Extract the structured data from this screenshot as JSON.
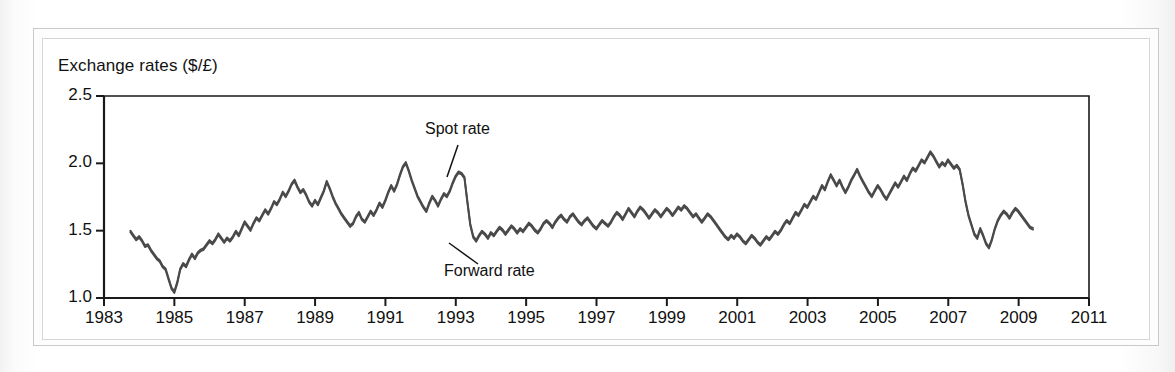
{
  "figure": {
    "title": "Exchange rates ($/£)",
    "line_color": "#4a4a4a",
    "axis_color": "#1a1a1a",
    "frame_color": "#c9c9c9"
  },
  "annotations": [
    {
      "name": "spot-rate",
      "label": "Spot rate",
      "x": 425,
      "y": 120,
      "leader": {
        "x1": 458,
        "y1": 145,
        "x2": 447,
        "y2": 177
      }
    },
    {
      "name": "forward-rate",
      "label": "Forward rate",
      "x": 444,
      "y": 262,
      "leader": {
        "x1": 449,
        "y1": 243,
        "x2": 478,
        "y2": 264
      }
    }
  ],
  "chart_data": {
    "type": "line",
    "title": "Exchange rates ($/£)",
    "xlabel": "",
    "ylabel": "Exchange rates ($/£)",
    "xlim": [
      1983,
      2011
    ],
    "ylim": [
      1.0,
      2.5
    ],
    "yticks": [
      1.0,
      1.5,
      2.0,
      2.5
    ],
    "ytick_labels": [
      "1.0",
      "1.5",
      "2.0",
      "2.5"
    ],
    "xticks": [
      1983,
      1985,
      1987,
      1989,
      1991,
      1993,
      1995,
      1997,
      1999,
      2001,
      2003,
      2005,
      2007,
      2009,
      2011
    ],
    "xtick_labels": [
      "1983",
      "1985",
      "1987",
      "1989",
      "1991",
      "1993",
      "1995",
      "1997",
      "1999",
      "2001",
      "2003",
      "2005",
      "2007",
      "2009",
      "2011"
    ],
    "grid": false,
    "legend": "annotated-inline",
    "legend_entries": [
      "Spot rate",
      "Forward rate"
    ],
    "note": "Spot and forward rate series lie almost on top of each other; drawn as two near-identical traces.",
    "series": [
      {
        "name": "Spot rate",
        "x_start": 1983.75,
        "x_step": 0.0833,
        "values": [
          1.5,
          1.47,
          1.44,
          1.46,
          1.43,
          1.39,
          1.4,
          1.36,
          1.33,
          1.3,
          1.28,
          1.24,
          1.22,
          1.15,
          1.08,
          1.05,
          1.12,
          1.22,
          1.26,
          1.24,
          1.29,
          1.33,
          1.3,
          1.34,
          1.36,
          1.37,
          1.4,
          1.43,
          1.41,
          1.44,
          1.48,
          1.45,
          1.42,
          1.45,
          1.43,
          1.46,
          1.5,
          1.47,
          1.52,
          1.57,
          1.54,
          1.51,
          1.56,
          1.6,
          1.58,
          1.62,
          1.66,
          1.63,
          1.67,
          1.72,
          1.7,
          1.74,
          1.79,
          1.76,
          1.8,
          1.85,
          1.88,
          1.83,
          1.79,
          1.81,
          1.77,
          1.72,
          1.69,
          1.73,
          1.7,
          1.75,
          1.8,
          1.87,
          1.82,
          1.76,
          1.71,
          1.67,
          1.63,
          1.6,
          1.57,
          1.54,
          1.56,
          1.61,
          1.64,
          1.59,
          1.57,
          1.61,
          1.65,
          1.62,
          1.66,
          1.71,
          1.68,
          1.73,
          1.79,
          1.84,
          1.8,
          1.85,
          1.92,
          1.98,
          2.01,
          1.95,
          1.88,
          1.82,
          1.76,
          1.72,
          1.68,
          1.65,
          1.71,
          1.76,
          1.73,
          1.69,
          1.74,
          1.78,
          1.76,
          1.8,
          1.86,
          1.91,
          1.94,
          1.93,
          1.9,
          1.72,
          1.55,
          1.46,
          1.43,
          1.47,
          1.5,
          1.48,
          1.45,
          1.49,
          1.47,
          1.5,
          1.53,
          1.51,
          1.48,
          1.51,
          1.54,
          1.52,
          1.49,
          1.52,
          1.5,
          1.53,
          1.56,
          1.54,
          1.51,
          1.49,
          1.52,
          1.56,
          1.58,
          1.56,
          1.53,
          1.57,
          1.6,
          1.62,
          1.59,
          1.57,
          1.61,
          1.63,
          1.6,
          1.57,
          1.55,
          1.58,
          1.6,
          1.57,
          1.54,
          1.52,
          1.55,
          1.58,
          1.56,
          1.54,
          1.57,
          1.61,
          1.64,
          1.62,
          1.59,
          1.63,
          1.67,
          1.64,
          1.61,
          1.65,
          1.68,
          1.66,
          1.63,
          1.6,
          1.63,
          1.66,
          1.64,
          1.61,
          1.64,
          1.67,
          1.65,
          1.62,
          1.65,
          1.68,
          1.66,
          1.69,
          1.67,
          1.64,
          1.61,
          1.63,
          1.6,
          1.57,
          1.6,
          1.63,
          1.61,
          1.58,
          1.55,
          1.52,
          1.49,
          1.46,
          1.44,
          1.47,
          1.45,
          1.48,
          1.46,
          1.43,
          1.41,
          1.44,
          1.47,
          1.45,
          1.42,
          1.4,
          1.43,
          1.46,
          1.44,
          1.47,
          1.5,
          1.48,
          1.51,
          1.55,
          1.58,
          1.56,
          1.6,
          1.64,
          1.62,
          1.66,
          1.7,
          1.68,
          1.72,
          1.76,
          1.74,
          1.79,
          1.84,
          1.81,
          1.87,
          1.92,
          1.88,
          1.84,
          1.88,
          1.83,
          1.79,
          1.83,
          1.88,
          1.92,
          1.96,
          1.91,
          1.87,
          1.83,
          1.79,
          1.76,
          1.8,
          1.84,
          1.81,
          1.77,
          1.74,
          1.78,
          1.82,
          1.86,
          1.83,
          1.87,
          1.91,
          1.88,
          1.93,
          1.97,
          1.95,
          1.99,
          2.03,
          2.01,
          2.05,
          2.09,
          2.06,
          2.02,
          1.98,
          2.01,
          1.99,
          2.03,
          2.0,
          1.97,
          1.99,
          1.96,
          1.85,
          1.72,
          1.62,
          1.55,
          1.48,
          1.45,
          1.52,
          1.47,
          1.41,
          1.38,
          1.44,
          1.52,
          1.58,
          1.62,
          1.65,
          1.63,
          1.6,
          1.64,
          1.67,
          1.65,
          1.62,
          1.59,
          1.56,
          1.53,
          1.52
        ]
      },
      {
        "name": "Forward rate",
        "offset": -0.012
      }
    ]
  },
  "geometry": {
    "plot_left": 104,
    "plot_right": 1089,
    "plot_top": 96,
    "plot_bottom": 298
  }
}
